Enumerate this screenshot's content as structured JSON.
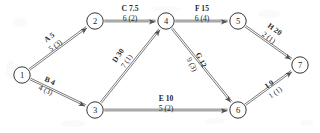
{
  "diagram": {
    "type": "network-diagram",
    "stroke_color": "#2b2b2b",
    "text_color": "#2a2a2a",
    "background": "#ffffff",
    "nodes": [
      {
        "id": "1",
        "label": "1",
        "x": 22,
        "y": 75
      },
      {
        "id": "2",
        "label": "2",
        "x": 95,
        "y": 21
      },
      {
        "id": "3",
        "label": "3",
        "x": 95,
        "y": 110
      },
      {
        "id": "4",
        "label": "4",
        "x": 166,
        "y": 21
      },
      {
        "id": "5",
        "label": "5",
        "x": 238,
        "y": 21
      },
      {
        "id": "6",
        "label": "6",
        "x": 238,
        "y": 110
      },
      {
        "id": "7",
        "label": "7",
        "x": 300,
        "y": 65
      }
    ],
    "edges": [
      {
        "id": "A",
        "from": "1",
        "to": "2",
        "top": "A 5",
        "bottom": "5 (3)",
        "lx": 52,
        "ly": 41,
        "rot": -36
      },
      {
        "id": "B",
        "from": "1",
        "to": "3",
        "top": "B 4",
        "bottom": "4 (3)",
        "lx": 48,
        "ly": 85,
        "rot": 24
      },
      {
        "id": "C",
        "from": "2",
        "to": "4",
        "top": "C 7.5",
        "bottom": "6 (2)",
        "lx": 130,
        "ly": 13,
        "rot": 0
      },
      {
        "id": "D",
        "from": "3",
        "to": "4",
        "top": "D 30",
        "bottom": "7 (1)",
        "lx": 122,
        "ly": 58,
        "rot": -57
      },
      {
        "id": "E",
        "from": "3",
        "to": "6",
        "top": "E 10",
        "bottom": "5 (2)",
        "lx": 166,
        "ly": 103,
        "rot": 0
      },
      {
        "id": "F",
        "from": "4",
        "to": "5",
        "top": "F 15",
        "bottom": "6 (4)",
        "lx": 202,
        "ly": 13,
        "rot": 0
      },
      {
        "id": "G",
        "from": "4",
        "to": "6",
        "top": "G 12",
        "bottom": "9 (3)",
        "lx": 197,
        "ly": 62,
        "rot": 64
      },
      {
        "id": "H",
        "from": "5",
        "to": "7",
        "top": "H 20",
        "bottom": "2 (1)",
        "lx": 272,
        "ly": 33,
        "rot": 36
      },
      {
        "id": "I",
        "from": "6",
        "to": "7",
        "top": "I 9",
        "bottom": "1 (1)",
        "lx": 272,
        "ly": 88,
        "rot": -36
      }
    ]
  }
}
